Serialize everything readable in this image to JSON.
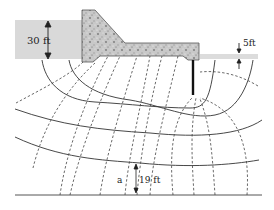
{
  "diagram": {
    "labels": {
      "upstream_head": "30 ft",
      "downstream_head": "5ft",
      "point_label": "a",
      "point_depth": "19 ft"
    },
    "colors": {
      "water": "#d9d9d9",
      "concrete": "#bdbdbd",
      "concrete_dark": "#6e6e6e",
      "flow_line": "#333333",
      "equipotential": "#444444",
      "sheet_pile": "#111111",
      "impervious_base": "#555555"
    },
    "elements": {
      "flow_lines_count": 4,
      "equipotential_lines_count": 13,
      "sheet_pile": true
    }
  }
}
